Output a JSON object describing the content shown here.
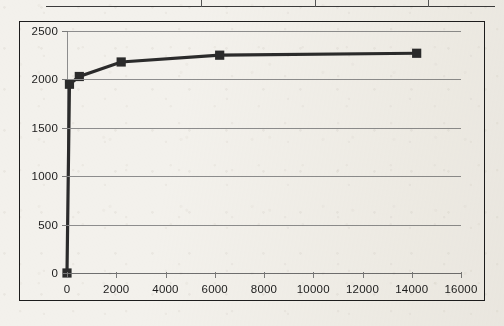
{
  "document": {
    "table_fragment": {
      "name": "table-bottom-edge",
      "column_divider_positions_pct": [
        34.5,
        60.0,
        85.0
      ]
    }
  },
  "chart_data": {
    "type": "line",
    "title": "",
    "subtitle": "",
    "xlabel": "",
    "ylabel": "",
    "xlim": [
      0,
      16000
    ],
    "ylim": [
      0,
      2500
    ],
    "grid": true,
    "legend": false,
    "legend_position": "none",
    "x_ticks": [
      0,
      2000,
      4000,
      6000,
      8000,
      10000,
      12000,
      14000,
      16000
    ],
    "x_tick_labels": [
      "0",
      "2000",
      "4000",
      "6000",
      "8000",
      "10000",
      "12000",
      "14000",
      "16000"
    ],
    "y_ticks": [
      0,
      500,
      1000,
      1500,
      2000,
      2500
    ],
    "y_tick_labels": [
      "0",
      "500",
      "1000",
      "1500",
      "2000",
      "2500"
    ],
    "series": [
      {
        "name": "Series 1",
        "color": "#2b2b2b",
        "marker": "square",
        "x": [
          0,
          100,
          500,
          2200,
          6200,
          14200
        ],
        "y": [
          0,
          1950,
          2030,
          2180,
          2250,
          2270
        ]
      }
    ]
  },
  "style": {
    "series_color": "#2b2b2b",
    "grid_color": "#8d8d8d",
    "frame_color": "#1d1d1d",
    "text_color": "#1b1b1b",
    "background": "#f3f1ec"
  }
}
